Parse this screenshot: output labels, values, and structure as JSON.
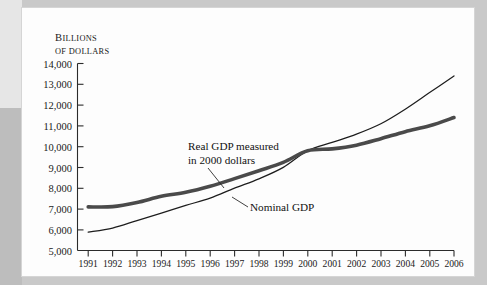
{
  "chart_data": {
    "type": "line",
    "title": "",
    "xlabel": "",
    "ylabel": "Billions of dollars",
    "ylabel_line1": "B",
    "ylabel_line1_rest": "ILLIONS",
    "ylabel_line2_first": "OF",
    "ylabel_line2_rest": "DOLLARS",
    "ylim": [
      5000,
      14000
    ],
    "ytick_step": 1000,
    "grid": false,
    "legend_position": "inline-annotations",
    "categories": [
      1991,
      1992,
      1993,
      1994,
      1995,
      1996,
      1997,
      1998,
      1999,
      2000,
      2001,
      2002,
      2003,
      2004,
      2005,
      2006
    ],
    "ytick_labels": [
      "5,000",
      "6,000",
      "7,000",
      "8,000",
      "9,000",
      "10,000",
      "11,000",
      "12,000",
      "13,000",
      "14,000"
    ],
    "xtick_labels": [
      "1991",
      "1992",
      "1993",
      "1994",
      "1995",
      "1996",
      "1997",
      "1998",
      "1999",
      "2000",
      "2001",
      "2002",
      "2003",
      "2004",
      "2005",
      "2006"
    ],
    "series": [
      {
        "name": "Real GDP measured in 2000 dollars",
        "style": "thick",
        "color": "#4a4a4a",
        "values": [
          7100,
          7110,
          7310,
          7610,
          7800,
          8090,
          8460,
          8840,
          9240,
          9800,
          9890,
          10070,
          10380,
          10720,
          11000,
          11400
        ]
      },
      {
        "name": "Nominal GDP",
        "style": "thin",
        "color": "#1d1d1d",
        "values": [
          5880,
          6080,
          6440,
          6800,
          7170,
          7520,
          8000,
          8450,
          9000,
          9800,
          10200,
          10600,
          11100,
          11800,
          12600,
          13400
        ]
      }
    ],
    "annotations": [
      {
        "id": "real-gdp-label",
        "line1": "Real GDP measured",
        "line2": "in 2000 dollars"
      },
      {
        "id": "nominal-gdp-label",
        "line1": "Nominal GDP"
      }
    ]
  }
}
